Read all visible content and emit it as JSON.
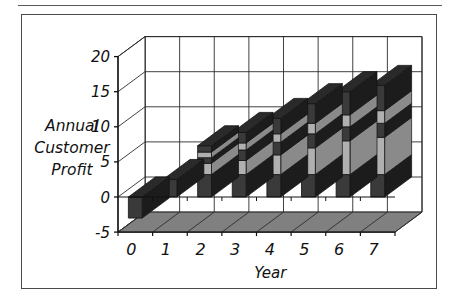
{
  "figure": {
    "background_color": "#ffffff",
    "border_color": "#4a4a4a",
    "has_top_rule": true
  },
  "axis_label_y_lines": [
    "Annual",
    "Customer",
    "Profit"
  ],
  "chart_data": {
    "type": "bar",
    "subtype": "stacked-column-3d",
    "title": "",
    "subtitle": "",
    "xlabel": "Year",
    "ylabel": "Annual Customer Profit",
    "categories": [
      "0",
      "1",
      "2",
      "3",
      "4",
      "5",
      "6",
      "7"
    ],
    "ylim": [
      -5,
      20
    ],
    "ytick_labels": [
      "-5",
      "0",
      "5",
      "10",
      "15",
      "20"
    ],
    "ytick_values": [
      -5,
      0,
      5,
      10,
      15,
      20
    ],
    "grid": true,
    "legend": "none",
    "legend_position": "none",
    "series": [
      {
        "name": "Segment 1",
        "color": "#3a3a3a",
        "values": [
          -3.0,
          2.5,
          3.2,
          3.2,
          3.2,
          3.2,
          3.2,
          3.2
        ]
      },
      {
        "name": "Segment 2",
        "color": "#b0b0b0",
        "values": [
          0,
          0,
          1.6,
          2.0,
          2.8,
          3.8,
          4.8,
          5.3
        ]
      },
      {
        "name": "Segment 3",
        "color": "#3a3a3a",
        "values": [
          0,
          0,
          0.8,
          1.5,
          1.8,
          2.0,
          2.0,
          2.0
        ]
      },
      {
        "name": "Segment 4",
        "color": "#b0b0b0",
        "values": [
          0,
          0,
          0.8,
          1.0,
          1.2,
          1.5,
          1.7,
          1.8
        ]
      },
      {
        "name": "Segment 5",
        "color": "#3a3a3a",
        "values": [
          0,
          0,
          0.9,
          1.5,
          2.2,
          2.8,
          3.3,
          3.6
        ]
      }
    ],
    "totals": [
      -3.0,
      2.5,
      7.3,
      9.2,
      11.2,
      13.3,
      15.0,
      15.9
    ],
    "bar_top_values": [
      -3.0,
      2.5,
      7.3,
      9.2,
      11.2,
      13.3,
      15.0,
      15.9
    ]
  },
  "colors": {
    "segment_dark": "#3a3a3a",
    "segment_light": "#b0b0b0",
    "segment_side_dark": "#1c1c1c",
    "segment_side_light": "#8a8a8a",
    "segment_top_dark": "#2a2a2a",
    "floor": "#808080",
    "grid": "#2b2b2b",
    "axis": "#111111"
  }
}
